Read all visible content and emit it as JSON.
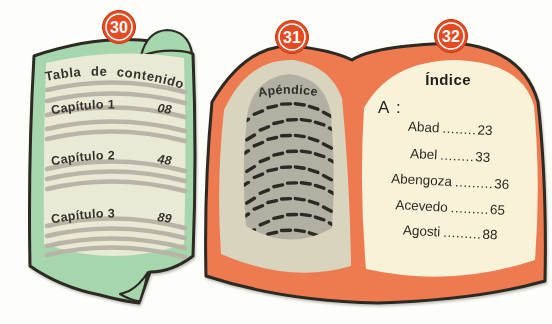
{
  "illustration": {
    "badges": [
      {
        "number": "30"
      },
      {
        "number": "31"
      },
      {
        "number": "32"
      }
    ],
    "closed_book": {
      "badge_number": "30",
      "title": "Tabla de contenido",
      "chapters": [
        {
          "name": "Capítulo 1",
          "page": "08"
        },
        {
          "name": "Capítulo 2",
          "page": "48"
        },
        {
          "name": "Capítulo 3",
          "page": "89"
        }
      ]
    },
    "open_book": {
      "left_page": {
        "badge_number": "31",
        "title": "Apéndice",
        "dash_rows": 9,
        "dash_cols": 7
      },
      "right_page": {
        "badge_number": "32",
        "title": "Índice",
        "section_label": "A :",
        "entries": [
          {
            "name": "Abad",
            "leader": "........",
            "page": "23"
          },
          {
            "name": "Abel",
            "leader": "........",
            "page": "33"
          },
          {
            "name": "Abengoza",
            "leader": ".........",
            "page": "36"
          },
          {
            "name": "Acevedo",
            "leader": ".........",
            "page": "65"
          },
          {
            "name": "Agosti",
            "leader": ".........",
            "page": "88"
          }
        ]
      }
    },
    "colors": {
      "cover_green": "#a6d6ac",
      "page_cream": "#eae9d6",
      "cover_orange": "#ee7a50",
      "page_beige": "#d8d4be",
      "panel_gray": "#b2b0a2",
      "page_light_cream": "#f8f3d8",
      "badge_red": "#e64a23",
      "outline_dark": "#2d2a24",
      "placeholder_gray": "#b8b5a7"
    }
  }
}
